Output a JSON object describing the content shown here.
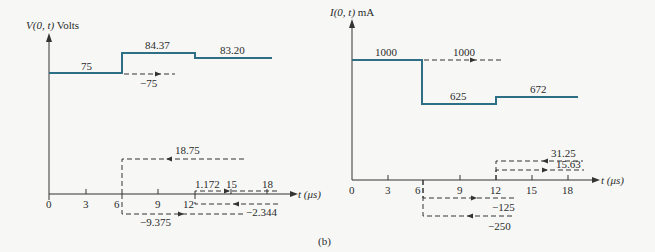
{
  "figure_label": "(b)",
  "colors": {
    "waveform": "#2f6f86",
    "axis": "#333333",
    "dashed": "#333333",
    "background": "#f7f8f6"
  },
  "left_plot": {
    "y_label_prefix": "V",
    "y_label_args": "(0, t)",
    "y_label_unit": "Volts",
    "x_label": "t (μs)",
    "x_ticks": [
      "0",
      "3",
      "6",
      "9",
      "12",
      "15",
      "18"
    ],
    "waveform_labels": [
      "75",
      "84.37",
      "83.20"
    ],
    "wave_labels": {
      "reflected_1": "−75",
      "incident_2": "18.75",
      "reflected_2": "−9.375",
      "incident_3": "1.172",
      "reflected_3": "−2.344"
    }
  },
  "right_plot": {
    "y_label_prefix": "I",
    "y_label_args": "(0, t)",
    "y_label_unit": "mA",
    "x_label": "t (μs)",
    "x_ticks": [
      "0",
      "3",
      "6",
      "9",
      "12",
      "15",
      "18"
    ],
    "waveform_labels": [
      "1000",
      "625",
      "672"
    ],
    "wave_labels": {
      "incident_1": "1000",
      "wave_a": "−125",
      "wave_b": "−250",
      "wave_c": "31.25",
      "wave_d": "15.63"
    }
  }
}
